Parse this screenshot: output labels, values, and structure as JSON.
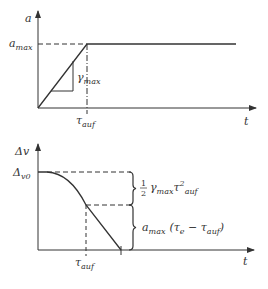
{
  "top_chart": {
    "y_label": "a",
    "x_label": "t",
    "level_label_main": "a",
    "level_label_sub": "max",
    "slope_label_main": "γ",
    "slope_label_sub": "max",
    "tick_label_main": "τ",
    "tick_label_sub": "auf"
  },
  "bottom_chart": {
    "y_label": "Δv",
    "x_label": "t",
    "start_label_main": "Δ",
    "start_label_sub": "v0",
    "tick_label_main": "τ",
    "tick_label_sub": "auf",
    "brace1_frac_num": "1",
    "brace1_frac_den": "2",
    "brace1_label_main": "γ",
    "brace1_label_sub": "max",
    "brace1_label_tau": "τ",
    "brace1_label_sup": "2",
    "brace1_label_sub2": "auf",
    "brace2_label_a": "a",
    "brace2_label_a_sub": "max",
    "brace2_label_open": "(τ",
    "brace2_label_e": "e",
    "brace2_label_minus": " − τ",
    "brace2_label_auf": "auf",
    "brace2_label_close": ")"
  },
  "colors": {
    "line": "#333333",
    "background": "#ffffff"
  }
}
